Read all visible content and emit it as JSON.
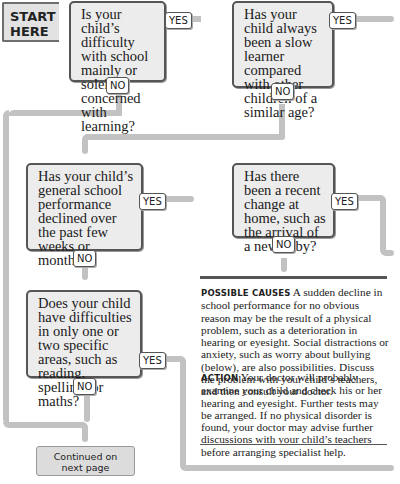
{
  "start": {
    "line1": "START",
    "line2": "HERE"
  },
  "questions": [
    {
      "id": "q1",
      "text": "Is your child’s difficulty with school mainly or solely concerned with learning?",
      "yes": "YES",
      "no": "NO"
    },
    {
      "id": "q2",
      "text": "Has your child always been a slow learner compared with other children of a similar age?",
      "yes": "YES",
      "no": "NO"
    },
    {
      "id": "q3",
      "text": "Has your child’s general school performance declined over the past few weeks or months?",
      "yes": "YES",
      "no": "NO"
    },
    {
      "id": "q4",
      "text": "Has there been a recent change at home, such as the arrival of a new baby?",
      "yes": "YES",
      "no": "NO"
    },
    {
      "id": "q5",
      "text": "Does your child have difficulties in only one or two specific areas, such as reading, spelling, or maths?",
      "yes": "YES",
      "no": "NO"
    }
  ],
  "info": {
    "causes_heading": "Possible causes",
    "causes_text": "A sudden decline in school performance for no obvious reason may be the result of a physical problem, such as a deterioration in hearing or eyesight. Social distractions or anxiety, such as worry about bullying (below), are also possibilities. Discuss the problem with your child’s teachers, and then consult your doctor.",
    "action_heading": "Action",
    "action_text": "Your doctor will probably examine your child and check his or her hearing and eyesight. Further tests may be arranged. If no physical disorder is found, your doctor may advise further discussions with your child’s teachers before arranging specialist help."
  },
  "continued": {
    "line1": "Continued on",
    "line2": "next page"
  },
  "colors": {
    "pipe": "#c2c2c2",
    "box_fill": "#ececec",
    "box_border": "#555555",
    "continued_fill": "#dcdcdc"
  }
}
